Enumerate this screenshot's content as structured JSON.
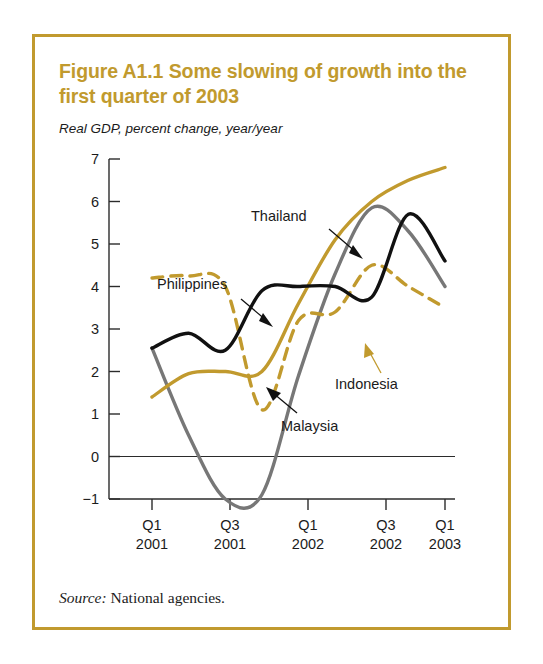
{
  "figure": {
    "title": "Figure A1.1  Some slowing of growth into the first quarter of 2003",
    "subtitle": "Real GDP, percent change, year/year",
    "source_label": "Source:",
    "source_text": "National agencies.",
    "frame_color": "#c19a2e"
  },
  "chart_data": {
    "type": "line",
    "title": "Figure A1.1  Some slowing of growth into the first quarter of 2003",
    "subtitle": "Real GDP, percent change, year/year",
    "xlabel": "",
    "ylabel": "",
    "ylim": [
      -1,
      7
    ],
    "yticks": [
      -1,
      0,
      1,
      2,
      3,
      4,
      5,
      6,
      7
    ],
    "ytick_labels": [
      "−1",
      "0",
      "1",
      "2",
      "3",
      "4",
      "5",
      "6",
      "7"
    ],
    "grid": false,
    "zero_line": true,
    "legend_position": "inline-annotations",
    "x": [
      "Q1 2001",
      "Q2 2001",
      "Q3 2001",
      "Q4 2001",
      "Q1 2002",
      "Q2 2002",
      "Q3 2002",
      "Q4 2002",
      "Q1 2003"
    ],
    "xtick_positions": [
      "Q1 2001",
      "Q3 2001",
      "Q1 2002",
      "Q3 2002",
      "Q1 2003"
    ],
    "xtick_labels": [
      {
        "quarter": "Q1",
        "year": "2001"
      },
      {
        "quarter": "Q3",
        "year": "2001"
      },
      {
        "quarter": "Q1",
        "year": "2002"
      },
      {
        "quarter": "Q3",
        "year": "2002"
      },
      {
        "quarter": "Q1",
        "year": "2003"
      }
    ],
    "series": [
      {
        "name": "Philippines",
        "color": "#111111",
        "style": "solid",
        "values": [
          2.55,
          2.9,
          2.5,
          3.9,
          4.0,
          4.0,
          3.75,
          5.7,
          4.6
        ]
      },
      {
        "name": "Thailand",
        "color": "#c19a2e",
        "style": "solid",
        "values": [
          1.4,
          1.95,
          2.0,
          2.0,
          3.6,
          5.1,
          6.0,
          6.5,
          6.8
        ]
      },
      {
        "name": "Indonesia",
        "color": "#c19a2e",
        "style": "dashed",
        "values": [
          4.2,
          4.25,
          4.0,
          1.1,
          3.2,
          3.4,
          4.5,
          4.0,
          3.5
        ]
      },
      {
        "name": "Malaysia",
        "color": "#777777",
        "style": "solid",
        "values": [
          2.55,
          0.5,
          -1.0,
          -0.9,
          1.9,
          4.3,
          5.85,
          5.3,
          4.0
        ]
      }
    ],
    "annotations": [
      {
        "label": "Thailand",
        "series": "Thailand",
        "arrow_color": "#111111"
      },
      {
        "label": "Philippines",
        "series": "Philippines",
        "arrow_color": "#111111"
      },
      {
        "label": "Indonesia",
        "series": "Indonesia",
        "arrow_color": "#c19a2e"
      },
      {
        "label": "Malaysia",
        "series": "Malaysia",
        "arrow_color": "#111111"
      }
    ]
  }
}
